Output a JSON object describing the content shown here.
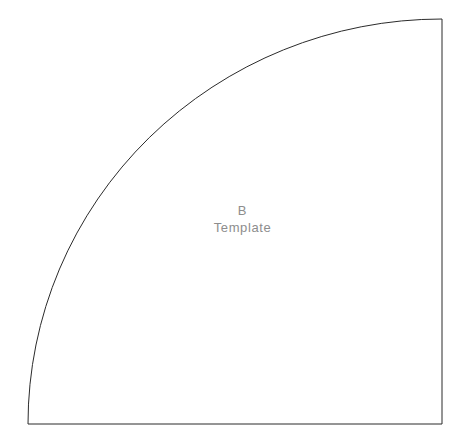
{
  "canvas": {
    "width": 466,
    "height": 447,
    "background_color": "#ffffff"
  },
  "shape": {
    "name": "quarter-circle-template",
    "description": "quarter circle fan outline",
    "stroke_color": "#2b2b2b",
    "stroke_width": 1,
    "fill": "none",
    "corner_bottom_left_x": 28,
    "corner_bottom_left_y": 424,
    "corner_bottom_right_x": 442,
    "corner_bottom_right_y": 424,
    "corner_top_right_x": 442,
    "corner_top_right_y": 19,
    "arc_radius_x": 414,
    "arc_radius_y": 405,
    "path": "M 28 424 L 442 424 L 442 19 A 414 405 0 0 0 28 424 Z"
  },
  "labels": {
    "letter": "B",
    "word": "Template",
    "text_color": "#8d8d8d"
  }
}
